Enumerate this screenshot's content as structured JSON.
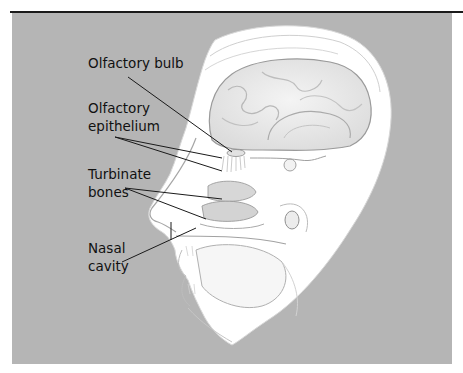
{
  "figure": {
    "colors": {
      "background_panel": "#b5b5b5",
      "head_fill": "#ffffff",
      "label_text": "#111111",
      "leader_lines": "#1a1a1a",
      "top_rule": "#1a1a1a"
    },
    "labels": [
      {
        "id": "olfactory-bulb",
        "lines": [
          "Olfactory bulb"
        ]
      },
      {
        "id": "olfactory-epithelium",
        "lines": [
          "Olfactory",
          "epithelium"
        ]
      },
      {
        "id": "turbinate-bones",
        "lines": [
          "Turbinate",
          "bones"
        ]
      },
      {
        "id": "nasal-cavity",
        "lines": [
          "Nasal",
          "cavity"
        ]
      }
    ]
  }
}
